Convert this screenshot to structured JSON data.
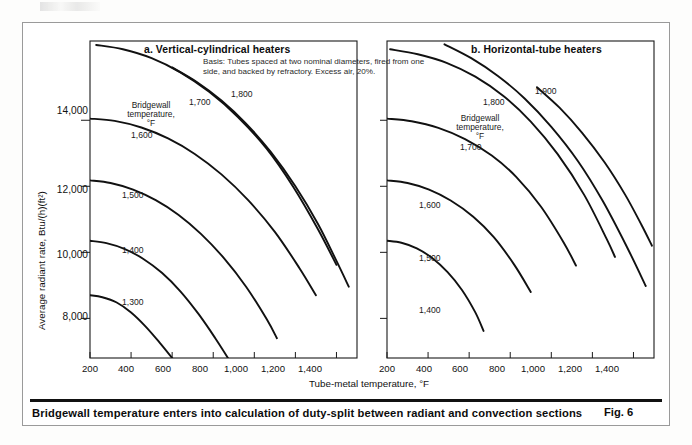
{
  "figure": {
    "caption": "Bridgewall temperature enters into calculation of duty-split between radiant and convection sections",
    "figure_number": "Fig. 6",
    "basis_note": "Basis: Tubes spaced at two nominal diameters, fired from one side, and backed by refractory. Excess air, 20%.",
    "legend_heading_line1": "Bridgewall",
    "legend_heading_line2": "temperature,",
    "legend_heading_line3": "°F"
  },
  "chart_data": [
    {
      "type": "line",
      "panel_id": "a",
      "title": "a. Vertical-cylindrical heaters",
      "xlabel": "Tube-metal temperature, °F",
      "ylabel": "Average radiant rate, Btu/(h)(ft²)",
      "xlim": [
        200,
        1500
      ],
      "ylim": [
        6800,
        16400
      ],
      "xticks": [
        200,
        400,
        600,
        800,
        1000,
        1200,
        1400
      ],
      "xtick_labels": [
        "200",
        "400",
        "600",
        "800",
        "1,000",
        "1,200",
        "1,400"
      ],
      "yticks": [
        8000,
        10000,
        12000,
        14000
      ],
      "ytick_labels": [
        "8,000",
        "10,000",
        "12,000",
        "14,000"
      ],
      "grid": false,
      "legend_position": "inline-curve-labels",
      "series": [
        {
          "name": "1,300",
          "label": "1,300",
          "x": [
            200,
            260,
            330,
            400,
            470,
            540,
            600,
            650,
            680
          ],
          "y": [
            8700,
            8640,
            8480,
            8180,
            7760,
            7260,
            6800,
            6400,
            6160
          ]
        },
        {
          "name": "1,400",
          "label": "1,400",
          "x": [
            200,
            280,
            370,
            460,
            550,
            640,
            730,
            810,
            880
          ],
          "y": [
            10350,
            10280,
            10100,
            9800,
            9380,
            8820,
            8120,
            7400,
            6720
          ]
        },
        {
          "name": "1,500",
          "label": "1,500",
          "x": [
            200,
            300,
            410,
            520,
            630,
            740,
            850,
            960,
            1060,
            1110
          ],
          "y": [
            12180,
            12100,
            11900,
            11580,
            11140,
            10560,
            9840,
            8960,
            7980,
            7400
          ]
        },
        {
          "name": "1,600",
          "label": "1,600",
          "x": [
            200,
            320,
            450,
            580,
            710,
            840,
            970,
            1100,
            1220,
            1300
          ],
          "y": [
            14050,
            13980,
            13780,
            13450,
            12980,
            12360,
            11580,
            10620,
            9520,
            8700
          ]
        },
        {
          "name": "1,700",
          "label": "1,700",
          "x": [
            230,
            360,
            500,
            640,
            780,
            920,
            1060,
            1190,
            1310,
            1400
          ],
          "y": [
            16280,
            16150,
            15880,
            15450,
            14860,
            14100,
            13140,
            11980,
            10700,
            9620
          ]
        },
        {
          "name": "1,800",
          "label": "1,800",
          "x": [
            600,
            720,
            840,
            960,
            1080,
            1200,
            1310,
            1400,
            1460
          ],
          "y": [
            15600,
            15160,
            14600,
            13900,
            13040,
            12000,
            10860,
            9740,
            8960
          ]
        }
      ]
    },
    {
      "type": "line",
      "panel_id": "b",
      "title": "b. Horizontal-tube heaters",
      "xlabel": "Tube-metal temperature, °F",
      "ylabel": "Average radiant rate, Btu/(h)(ft²)",
      "xlim": [
        200,
        1500
      ],
      "ylim": [
        6800,
        16400
      ],
      "xticks": [
        200,
        400,
        600,
        800,
        1000,
        1200,
        1400
      ],
      "xtick_labels": [
        "200",
        "400",
        "600",
        "800",
        "1,000",
        "1,200",
        "1,400"
      ],
      "yticks": [
        8000,
        10000,
        12000,
        14000
      ],
      "ytick_labels": [
        "",
        "",
        "",
        ""
      ],
      "grid": false,
      "legend_position": "inline-curve-labels",
      "series": [
        {
          "name": "1,400",
          "label": "1,400",
          "x": [
            200,
            270,
            345,
            420,
            495,
            565,
            630,
            670
          ],
          "y": [
            10350,
            10290,
            10120,
            9830,
            9400,
            8860,
            8180,
            7620
          ]
        },
        {
          "name": "1,500",
          "label": "1,500",
          "x": [
            200,
            300,
            405,
            510,
            620,
            720,
            820,
            900
          ],
          "y": [
            12180,
            12100,
            11900,
            11570,
            11080,
            10460,
            9620,
            8800
          ]
        },
        {
          "name": "1,600",
          "label": "1,600",
          "x": [
            200,
            320,
            450,
            580,
            710,
            830,
            950,
            1060,
            1120
          ],
          "y": [
            14050,
            13970,
            13770,
            13430,
            12930,
            12280,
            11380,
            10300,
            9600
          ]
        },
        {
          "name": "1,700",
          "label": "1,700",
          "x": [
            215,
            350,
            490,
            630,
            770,
            900,
            1030,
            1160,
            1270,
            1310
          ],
          "y": [
            16150,
            16000,
            15740,
            15320,
            14720,
            13960,
            12980,
            11740,
            10400,
            9860
          ]
        },
        {
          "name": "1,800",
          "label": "1,800",
          "x": [
            480,
            610,
            740,
            870,
            1000,
            1130,
            1250,
            1370,
            1460
          ],
          "y": [
            16300,
            15880,
            15340,
            14660,
            13800,
            12760,
            11560,
            10140,
            8980
          ]
        },
        {
          "name": "1,900",
          "label": "1,900",
          "x": [
            930,
            1040,
            1150,
            1260,
            1360,
            1440,
            1490
          ],
          "y": [
            15000,
            14380,
            13620,
            12720,
            11740,
            10820,
            10200
          ]
        }
      ]
    }
  ]
}
